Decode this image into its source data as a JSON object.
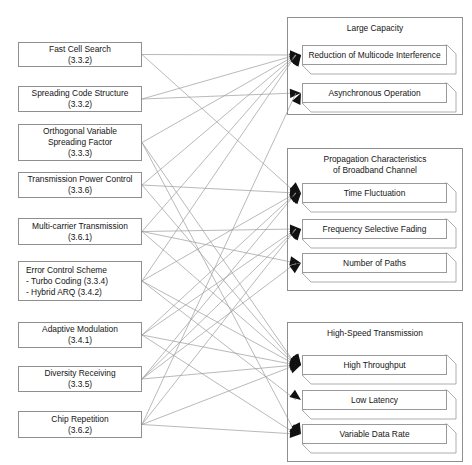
{
  "diagram": {
    "type": "mapping-diagram",
    "line_color": "#9b9b9b",
    "box_border_color": "#8f8f8f",
    "background": "#ffffff"
  },
  "left_boxes": [
    {
      "id": "fast-cell-search",
      "lines": [
        "Fast Cell Search",
        "(3.3.2)"
      ],
      "x": 18,
      "y": 42,
      "w": 124,
      "h": 25,
      "align": "center"
    },
    {
      "id": "spreading-code",
      "lines": [
        "Spreading Code Structure",
        "(3.3.2)"
      ],
      "x": 18,
      "y": 86,
      "w": 124,
      "h": 26,
      "align": "center"
    },
    {
      "id": "ovsf",
      "lines": [
        "Orthogonal Variable",
        "Spreading Factor",
        "(3.3.3)"
      ],
      "x": 18,
      "y": 124,
      "w": 124,
      "h": 37,
      "align": "center"
    },
    {
      "id": "power-control",
      "lines": [
        "Transmission Power Control",
        "(3.3.6)"
      ],
      "x": 18,
      "y": 172,
      "w": 124,
      "h": 26,
      "align": "center"
    },
    {
      "id": "multi-carrier",
      "lines": [
        "Multi-carrier Transmission",
        "(3.6.1)"
      ],
      "x": 18,
      "y": 218,
      "w": 124,
      "h": 27,
      "align": "center"
    },
    {
      "id": "error-control",
      "lines": [
        "Error Control Scheme",
        "- Turbo Coding (3.3.4)",
        "- Hybrid ARQ (3.4.2)"
      ],
      "x": 18,
      "y": 261,
      "w": 124,
      "h": 40,
      "align": "left"
    },
    {
      "id": "adaptive-modulation",
      "lines": [
        "Adaptive Modulation",
        "(3.4.1)"
      ],
      "x": 18,
      "y": 322,
      "w": 124,
      "h": 26,
      "align": "center"
    },
    {
      "id": "diversity-receiving",
      "lines": [
        "Diversity Receiving",
        "(3.3.5)"
      ],
      "x": 18,
      "y": 366,
      "w": 124,
      "h": 26,
      "align": "center"
    },
    {
      "id": "chip-repetition",
      "lines": [
        "Chip Repetition",
        "(3.6.2)"
      ],
      "x": 18,
      "y": 411,
      "w": 124,
      "h": 27,
      "align": "center"
    }
  ],
  "right_panels": [
    {
      "id": "large-capacity",
      "title_lines": [
        "Large Capacity"
      ],
      "x": 287,
      "y": 17,
      "w": 176,
      "h": 98,
      "items": [
        {
          "id": "reduction-multicode-interference",
          "label": "Reduction of Multicode  Interference",
          "x": 302,
          "y": 45,
          "w": 145,
          "h": 20
        },
        {
          "id": "asynchronous-operation",
          "label": "Asynchronous Operation",
          "x": 302,
          "y": 83,
          "w": 145,
          "h": 20
        }
      ]
    },
    {
      "id": "propagation-characteristics",
      "title_lines": [
        "Propagation Characteristics",
        "of Broadband Channel"
      ],
      "x": 287,
      "y": 148,
      "w": 176,
      "h": 143,
      "items": [
        {
          "id": "time-fluctuation",
          "label": "Time Fluctuation",
          "x": 302,
          "y": 183,
          "w": 145,
          "h": 20
        },
        {
          "id": "frequency-selective-fading",
          "label": "Frequency Selective  Fading",
          "x": 302,
          "y": 219,
          "w": 145,
          "h": 20
        },
        {
          "id": "number-of-paths",
          "label": "Number of Paths",
          "x": 302,
          "y": 253,
          "w": 145,
          "h": 20
        }
      ]
    },
    {
      "id": "high-speed-transmission",
      "title_lines": [
        "High-Speed Transmission"
      ],
      "x": 287,
      "y": 322,
      "w": 176,
      "h": 140,
      "items": [
        {
          "id": "high-throughput",
          "label": "High Throughput",
          "x": 302,
          "y": 355,
          "w": 145,
          "h": 20
        },
        {
          "id": "low-latency",
          "label": "Low Latency",
          "x": 302,
          "y": 390,
          "w": 145,
          "h": 20
        },
        {
          "id": "variable-data-rate",
          "label": "Variable Data Rate",
          "x": 302,
          "y": 424,
          "w": 145,
          "h": 20
        }
      ]
    }
  ],
  "connections": [
    {
      "from": "fast-cell-search",
      "to": "reduction-multicode-interference"
    },
    {
      "from": "fast-cell-search",
      "to": "time-fluctuation"
    },
    {
      "from": "spreading-code",
      "to": "reduction-multicode-interference"
    },
    {
      "from": "spreading-code",
      "to": "asynchronous-operation"
    },
    {
      "from": "ovsf",
      "to": "reduction-multicode-interference"
    },
    {
      "from": "ovsf",
      "to": "high-throughput"
    },
    {
      "from": "ovsf",
      "to": "variable-data-rate"
    },
    {
      "from": "power-control",
      "to": "reduction-multicode-interference"
    },
    {
      "from": "power-control",
      "to": "time-fluctuation"
    },
    {
      "from": "power-control",
      "to": "high-throughput"
    },
    {
      "from": "multi-carrier",
      "to": "reduction-multicode-interference"
    },
    {
      "from": "multi-carrier",
      "to": "frequency-selective-fading"
    },
    {
      "from": "multi-carrier",
      "to": "number-of-paths"
    },
    {
      "from": "multi-carrier",
      "to": "high-throughput"
    },
    {
      "from": "error-control",
      "to": "reduction-multicode-interference"
    },
    {
      "from": "error-control",
      "to": "time-fluctuation"
    },
    {
      "from": "error-control",
      "to": "high-throughput"
    },
    {
      "from": "error-control",
      "to": "low-latency"
    },
    {
      "from": "adaptive-modulation",
      "to": "time-fluctuation"
    },
    {
      "from": "adaptive-modulation",
      "to": "frequency-selective-fading"
    },
    {
      "from": "adaptive-modulation",
      "to": "high-throughput"
    },
    {
      "from": "adaptive-modulation",
      "to": "variable-data-rate"
    },
    {
      "from": "diversity-receiving",
      "to": "time-fluctuation"
    },
    {
      "from": "diversity-receiving",
      "to": "frequency-selective-fading"
    },
    {
      "from": "diversity-receiving",
      "to": "number-of-paths"
    },
    {
      "from": "diversity-receiving",
      "to": "high-throughput"
    },
    {
      "from": "chip-repetition",
      "to": "asynchronous-operation"
    },
    {
      "from": "chip-repetition",
      "to": "frequency-selective-fading"
    },
    {
      "from": "chip-repetition",
      "to": "high-throughput"
    },
    {
      "from": "chip-repetition",
      "to": "variable-data-rate"
    }
  ]
}
